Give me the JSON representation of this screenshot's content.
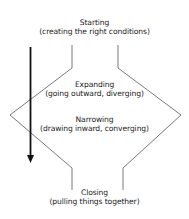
{
  "diagram": {
    "stages": [
      {
        "title": "Starting",
        "subtitle": "(creating the right conditions)"
      },
      {
        "title": "Expanding",
        "subtitle": "(going outward, diverging)"
      },
      {
        "title": "Narrowing",
        "subtitle": "(drawing inward, converging)"
      },
      {
        "title": "Closing",
        "subtitle": "(pulling things together)"
      }
    ],
    "arrow": {
      "direction": "down",
      "meaning": "time / progression"
    },
    "colors": {
      "line": "#555555",
      "arrow": "#111111",
      "text": "#222222"
    }
  }
}
